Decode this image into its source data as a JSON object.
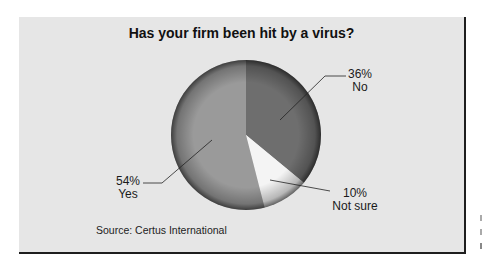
{
  "chart_data": {
    "type": "pie",
    "title": "Has your firm been hit by a virus?",
    "slices": [
      {
        "label": "No",
        "value": 36,
        "display": "36%",
        "color": "#6e6e6e"
      },
      {
        "label": "Not sure",
        "value": 10,
        "display": "10%",
        "color": "#f4f4f4"
      },
      {
        "label": "Yes",
        "value": 54,
        "display": "54%",
        "color": "#9a9a9a"
      }
    ],
    "start_angle": "12 o'clock, clockwise",
    "source": "Source: Certus International"
  },
  "labels": {
    "no_pct": "36%",
    "no_name": "No",
    "notsure_pct": "10%",
    "notsure_name": "Not sure",
    "yes_pct": "54%",
    "yes_name": "Yes"
  },
  "colors": {
    "panel_bg": "#e6e6e6",
    "shadow": "#1e1e1e"
  }
}
